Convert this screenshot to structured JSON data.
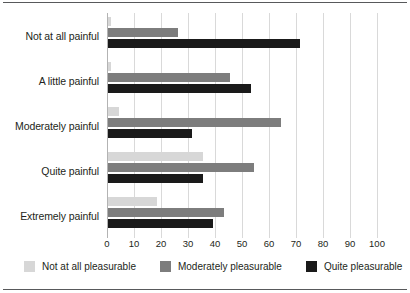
{
  "chart_data": {
    "type": "bar",
    "orientation": "horizontal",
    "title": "",
    "subtitle": "",
    "xlabel": "",
    "ylabel": "",
    "xlim": [
      0,
      100
    ],
    "xticks": [
      0,
      10,
      20,
      30,
      40,
      50,
      60,
      70,
      80,
      90,
      100
    ],
    "grid": true,
    "legend_position": "bottom",
    "categories": [
      "Not at all painful",
      "A little painful",
      "Moderately painful",
      "Quite painful",
      "Extremely painful"
    ],
    "series": [
      {
        "name": "Not at all pleasurable",
        "color": "#d7d7d7",
        "values": [
          1,
          1,
          4,
          35,
          18
        ]
      },
      {
        "name": "Moderately pleasurable",
        "color": "#7d7d7d",
        "values": [
          26,
          45,
          64,
          54,
          43
        ]
      },
      {
        "name": "Quite pleasurable",
        "color": "#1a1a1a",
        "values": [
          71,
          53,
          31,
          35,
          39
        ]
      }
    ]
  },
  "colors": {
    "series_light": "#d7d7d7",
    "series_medium": "#7d7d7d",
    "series_dark": "#1a1a1a",
    "gridline": "#d9d9d9",
    "rule": "#58595b",
    "text": "#231f20",
    "background": "#ffffff"
  }
}
